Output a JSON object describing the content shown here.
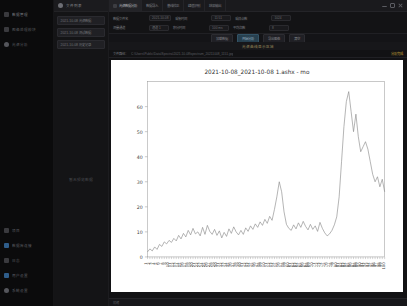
{
  "rail": {
    "top_items": [
      {
        "label": "数据管理",
        "icon": "folder-icon"
      },
      {
        "label": "图像处理模块",
        "icon": "image-icon"
      },
      {
        "label": "光谱分析",
        "icon": "chart-icon"
      }
    ],
    "bottom_items": [
      {
        "label": "项目",
        "icon": "grid-icon"
      },
      {
        "label": "数据库连接",
        "icon": "database-icon"
      },
      {
        "label": "日志",
        "icon": "log-icon"
      },
      {
        "label": "用户设置",
        "icon": "user-icon"
      },
      {
        "label": "系统设置",
        "icon": "gear-icon"
      }
    ]
  },
  "panel2": {
    "header": "文件列表",
    "items": [
      "2021-10-08 光谱数据",
      "2021-10-08 测试数据",
      "2021-10-08 历史记录"
    ],
    "empty_text": "暂无预览数据"
  },
  "tabs": [
    {
      "label": "光谱数据分析",
      "active": true
    },
    {
      "label": "数据导入",
      "active": false
    },
    {
      "label": "基线校正",
      "active": false
    },
    {
      "label": "峰值识别",
      "active": false
    },
    {
      "label": "结果输出",
      "active": false
    }
  ],
  "window_controls": {
    "minimize": "minimize-icon",
    "maximize": "maximize-icon",
    "close": "close-icon"
  },
  "form": {
    "rows": [
      {
        "label": "数据文件名",
        "value": "2021-10-08",
        "field2_label": "采集时间",
        "field2_value": "11:51",
        "field3_label": "采样点数",
        "field3_value": "1024"
      },
      {
        "label": "测量通道",
        "value": "通道 1",
        "field2_label": "积分时间",
        "field2_value": "100 ms",
        "field3_label": "平均次数",
        "field3_value": "8"
      }
    ],
    "buttons": [
      {
        "label": "加载数据",
        "primary": false
      },
      {
        "label": "开始分析",
        "primary": true
      },
      {
        "label": "导出图像",
        "primary": false
      },
      {
        "label": "清空",
        "primary": false
      }
    ]
  },
  "section_header": "光谱曲线显示区域",
  "path_bar": {
    "key": "文件路径：",
    "value": "C:\\Users\\Public\\Data\\Spectra\\2021-10-08\\spectrum_20211008_1151.jpg",
    "badge": "分析完成"
  },
  "bottom_bar": {
    "status": "就绪"
  },
  "chart_data": {
    "type": "line",
    "title": "2021-10-08_2021-10-08 1.ashx - mo",
    "xlabel": "",
    "ylabel": "",
    "ylim": [
      0,
      70
    ],
    "yticks": [
      0,
      10,
      20,
      30,
      40,
      50,
      60
    ],
    "grid": false,
    "legend": "none",
    "line_color": "#8a8a8a",
    "categories": [
      "1",
      "2",
      "3",
      "4",
      "5",
      "6",
      "7",
      "8",
      "9",
      "10",
      "11",
      "12",
      "13",
      "14",
      "15",
      "16",
      "17",
      "18",
      "19",
      "20",
      "21",
      "22",
      "23",
      "24",
      "25",
      "26",
      "27",
      "28",
      "29",
      "30",
      "31",
      "32",
      "33",
      "34",
      "35",
      "36",
      "37",
      "38",
      "39",
      "40",
      "41",
      "42",
      "43",
      "44",
      "45",
      "46",
      "47",
      "48",
      "49",
      "50",
      "51",
      "52",
      "53",
      "54",
      "55",
      "56",
      "57",
      "58",
      "59",
      "60",
      "61",
      "62",
      "63",
      "64",
      "65",
      "66",
      "67",
      "68",
      "69",
      "70",
      "71",
      "72",
      "73",
      "74",
      "75",
      "76",
      "77",
      "78",
      "79",
      "80",
      "81",
      "82",
      "83",
      "84",
      "85",
      "86",
      "87",
      "88",
      "89",
      "90",
      "91",
      "92",
      "93",
      "94",
      "95",
      "96",
      "97",
      "98",
      "99",
      "100"
    ],
    "values": [
      2.0,
      3.2,
      2.4,
      4.0,
      3.0,
      5.0,
      4.2,
      6.0,
      5.2,
      6.6,
      5.8,
      7.4,
      6.4,
      8.6,
      7.2,
      9.4,
      8.0,
      10.6,
      8.8,
      11.4,
      9.2,
      10.0,
      8.4,
      11.8,
      9.0,
      12.6,
      10.2,
      9.0,
      11.0,
      8.6,
      10.4,
      7.6,
      9.8,
      8.2,
      11.2,
      9.4,
      12.0,
      10.0,
      8.8,
      10.6,
      9.0,
      11.6,
      10.2,
      12.4,
      11.0,
      13.2,
      11.8,
      14.0,
      12.6,
      15.0,
      13.4,
      16.2,
      14.6,
      19.0,
      24.0,
      30.0,
      26.0,
      18.0,
      13.0,
      11.4,
      10.6,
      12.8,
      11.2,
      13.6,
      11.8,
      14.2,
      12.2,
      10.8,
      13.0,
      11.0,
      12.4,
      10.2,
      13.8,
      11.4,
      9.6,
      8.4,
      9.2,
      10.6,
      12.8,
      16.0,
      24.0,
      38.0,
      52.0,
      62.0,
      66.0,
      58.0,
      50.0,
      57.0,
      48.0,
      42.0,
      44.0,
      46.0,
      43.0,
      38.0,
      33.0,
      30.0,
      32.0,
      28.0,
      31.0,
      26.0
    ]
  }
}
